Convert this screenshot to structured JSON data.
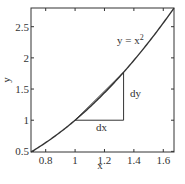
{
  "chart_data": {
    "type": "line",
    "title": "",
    "xlabel": "x",
    "ylabel": "y",
    "xlim": [
      0.7,
      1.673
    ],
    "ylim": [
      0.49,
      2.8
    ],
    "xticks": [
      0.8,
      1,
      1.2,
      1.4,
      1.6
    ],
    "xtick_labels": [
      "0.8",
      "1",
      "1.2",
      "1.4",
      "1.6"
    ],
    "yticks": [
      0.5,
      1,
      1.5,
      2,
      2.5
    ],
    "ytick_labels": [
      "0.5",
      "1",
      "1.5",
      "2",
      "2.5"
    ],
    "grid": false,
    "legend": null,
    "series": [
      {
        "name": "y = x^2",
        "function": "x^2",
        "x": [
          0.7,
          0.8,
          0.9,
          1.0,
          1.1,
          1.2,
          1.3,
          1.4,
          1.5,
          1.6,
          1.673
        ],
        "values": [
          0.49,
          0.64,
          0.81,
          1.0,
          1.21,
          1.44,
          1.69,
          1.96,
          2.25,
          2.56,
          2.8
        ],
        "color": "#333333"
      }
    ],
    "annotations": [
      {
        "text": "y = x²",
        "x": 1.25,
        "y": 2.35,
        "type": "curve-label"
      },
      {
        "text": "dx",
        "x": 1.16,
        "y": 0.9,
        "type": "triangle-leg-label"
      },
      {
        "text": "dy",
        "x": 1.37,
        "y": 1.4,
        "type": "triangle-leg-label"
      }
    ],
    "triangle": {
      "x0": 1.0,
      "y0": 1.0,
      "x1": 1.33,
      "y1": 1.77,
      "description": "right triangle with horizontal leg dx from (1,1) to (1.33,1) and vertical leg dy from (1.33,1) to (1.33,1.77); hypotenuse is the secant line"
    }
  },
  "labels": {
    "curve": "y = x",
    "curve_sup": "2",
    "dx": "dx",
    "dy": "dy",
    "xlabel": "x",
    "ylabel": "y"
  }
}
